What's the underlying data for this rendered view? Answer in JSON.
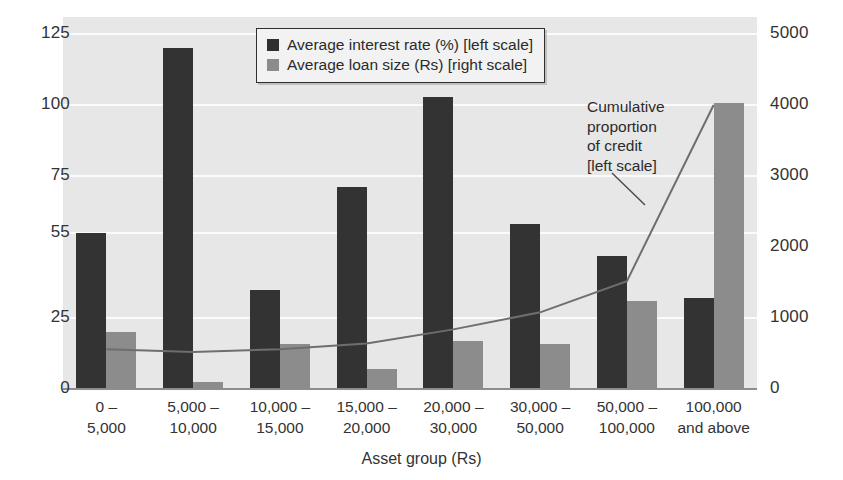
{
  "chart_data": {
    "type": "bar",
    "title": "",
    "xlabel": "Asset group (Rs)",
    "ylabel": "",
    "categories": [
      "0 –\n5,000",
      "5,000 –\n10,000",
      "10,000 –\n15,000",
      "15,000 –\n20,000",
      "20,000 –\n30,000",
      "30,000 –\n50,000",
      "50,000 –\n100,000",
      "100,000\nand above"
    ],
    "left_axis": {
      "ticks": [
        0,
        25,
        55,
        75,
        100,
        125
      ],
      "tick_labels": [
        "0",
        "25",
        "55",
        "75",
        "100",
        "125"
      ],
      "ylim": [
        0,
        131
      ]
    },
    "right_axis": {
      "ticks": [
        0,
        1000,
        2000,
        3000,
        4000,
        5000
      ],
      "tick_labels": [
        "0",
        "1000",
        "2000",
        "3000",
        "4000",
        "5000"
      ],
      "ylim": [
        0,
        5240
      ]
    },
    "grid": true,
    "legend_position": "top-center",
    "series": [
      {
        "name": "Average interest rate (%) [left scale]",
        "type": "bar",
        "axis": "left",
        "color": "#333333",
        "values": [
          55,
          120,
          35,
          71,
          103,
          58,
          47,
          32
        ]
      },
      {
        "name": "Average loan size (Rs) [right scale]",
        "type": "bar",
        "axis": "right",
        "color": "#8c8c8c",
        "values": [
          800,
          100,
          640,
          280,
          670,
          640,
          1240,
          4030
        ]
      },
      {
        "name": "Cumulative proportion of credit [left scale]",
        "type": "line",
        "axis": "left",
        "color": "#6e6e6e",
        "values": [
          14,
          13,
          14,
          16,
          21,
          27,
          38,
          100
        ]
      }
    ]
  },
  "legend": {
    "items": [
      {
        "label": "Average interest rate (%) [left scale]",
        "swatch": "dark"
      },
      {
        "label": "Average loan size (Rs) [right scale]",
        "swatch": "gray"
      }
    ]
  },
  "annotation": {
    "text": "Cumulative\nproportion\nof credit\n[left scale]"
  },
  "colors": {
    "bar_dark": "#333333",
    "bar_gray": "#8c8c8c",
    "line": "#6e6e6e",
    "plot_background": "#e7e7e7",
    "gridline": "#fbfbfb",
    "text": "#333333"
  }
}
